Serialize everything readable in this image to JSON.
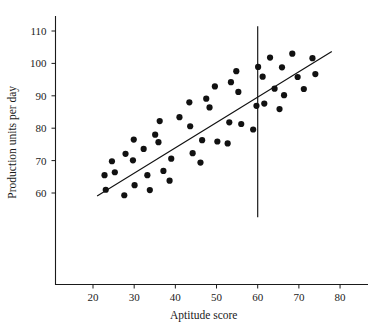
{
  "chart_data": {
    "type": "scatter",
    "title": "",
    "xlabel": "Aptitude score",
    "ylabel": "Production units per day",
    "xlim": [
      13,
      85
    ],
    "ylim": [
      52,
      114
    ],
    "xticks": [
      20,
      30,
      40,
      50,
      60,
      70,
      80
    ],
    "yticks": [
      60,
      70,
      80,
      90,
      100,
      110
    ],
    "grid": false,
    "legend": null,
    "annotations": [
      {
        "name": "vertical-cutoff-line",
        "type": "vline",
        "x": 60,
        "y_from": 52.5,
        "y_to": 111.5,
        "color": "#111111"
      },
      {
        "name": "regression-line",
        "type": "line",
        "x_from": 21,
        "x_to": 78,
        "y_from": 59.1,
        "y_to": 103.7,
        "color": "#111111"
      }
    ],
    "marker": {
      "shape": "circle",
      "color": "#111111",
      "size": 3.1
    },
    "points": [
      {
        "x": 22.8,
        "y": 65.5
      },
      {
        "x": 24.6,
        "y": 69.8
      },
      {
        "x": 23.1,
        "y": 61.0
      },
      {
        "x": 25.3,
        "y": 66.4
      },
      {
        "x": 27.6,
        "y": 59.3
      },
      {
        "x": 27.9,
        "y": 72.1
      },
      {
        "x": 29.7,
        "y": 70.1
      },
      {
        "x": 29.9,
        "y": 76.5
      },
      {
        "x": 30.1,
        "y": 62.4
      },
      {
        "x": 32.3,
        "y": 73.6
      },
      {
        "x": 33.2,
        "y": 65.5
      },
      {
        "x": 33.8,
        "y": 60.9
      },
      {
        "x": 35.1,
        "y": 78.0
      },
      {
        "x": 35.9,
        "y": 75.7
      },
      {
        "x": 36.2,
        "y": 82.2
      },
      {
        "x": 37.1,
        "y": 66.8
      },
      {
        "x": 38.6,
        "y": 63.8
      },
      {
        "x": 39.0,
        "y": 70.6
      },
      {
        "x": 41.0,
        "y": 83.4
      },
      {
        "x": 43.4,
        "y": 88.0
      },
      {
        "x": 43.6,
        "y": 80.6
      },
      {
        "x": 44.2,
        "y": 72.3
      },
      {
        "x": 46.1,
        "y": 69.4
      },
      {
        "x": 46.5,
        "y": 76.3
      },
      {
        "x": 47.5,
        "y": 89.1
      },
      {
        "x": 48.3,
        "y": 86.4
      },
      {
        "x": 49.6,
        "y": 92.9
      },
      {
        "x": 50.2,
        "y": 75.9
      },
      {
        "x": 52.7,
        "y": 75.3
      },
      {
        "x": 53.1,
        "y": 81.8
      },
      {
        "x": 53.5,
        "y": 94.2
      },
      {
        "x": 54.8,
        "y": 97.6
      },
      {
        "x": 55.3,
        "y": 91.2
      },
      {
        "x": 56.0,
        "y": 81.3
      },
      {
        "x": 58.9,
        "y": 79.6
      },
      {
        "x": 59.7,
        "y": 86.9
      },
      {
        "x": 60.1,
        "y": 98.9
      },
      {
        "x": 61.2,
        "y": 95.9
      },
      {
        "x": 61.6,
        "y": 87.6
      },
      {
        "x": 63.0,
        "y": 101.8
      },
      {
        "x": 64.1,
        "y": 92.2
      },
      {
        "x": 65.3,
        "y": 85.9
      },
      {
        "x": 65.9,
        "y": 98.8
      },
      {
        "x": 66.4,
        "y": 90.2
      },
      {
        "x": 68.4,
        "y": 103.0
      },
      {
        "x": 69.7,
        "y": 95.8
      },
      {
        "x": 71.2,
        "y": 92.1
      },
      {
        "x": 73.3,
        "y": 101.6
      },
      {
        "x": 74.0,
        "y": 96.7
      }
    ]
  },
  "axes": {
    "x_axis_name": "x-axis",
    "y_axis_name": "y-axis"
  }
}
